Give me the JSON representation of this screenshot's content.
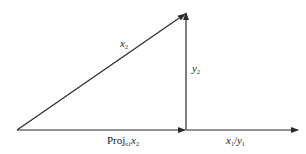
{
  "diagram": {
    "type": "vector-projection",
    "stroke_color": "#2a2a2a",
    "labels": {
      "hypotenuse": {
        "base": "x",
        "sub": "2"
      },
      "vertical": {
        "base": "y",
        "sub": "2"
      },
      "projection": {
        "prefix": "Proj",
        "sub": "x1",
        "base": "x",
        "base_sub": "2"
      },
      "axis": {
        "a": "x",
        "a_sub": "1",
        "sep": "/",
        "b": "y",
        "b_sub": "1"
      }
    }
  }
}
